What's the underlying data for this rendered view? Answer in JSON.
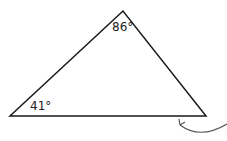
{
  "diagram": {
    "shape": "triangle",
    "vertices": {
      "apex": [
        123,
        11
      ],
      "bottom_left": [
        10,
        116
      ],
      "bottom_right": [
        206,
        116
      ]
    },
    "angles": [
      {
        "vertex": "apex",
        "label": "86°"
      },
      {
        "vertex": "bottom_left",
        "label": "41°"
      },
      {
        "vertex": "bottom_right",
        "label": ""
      }
    ],
    "annotation": {
      "type": "curved-arrow",
      "points_to": "bottom_right"
    },
    "stroke_color": "#1a1a1a",
    "arrow_color": "#555555"
  }
}
